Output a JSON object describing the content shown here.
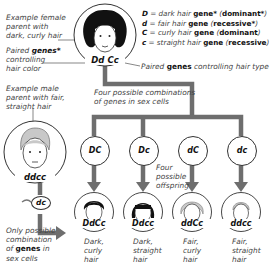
{
  "legend": [
    {
      "symbol": "D",
      "text": "dark hair",
      "gene": "gene*",
      "type": "dominant*"
    },
    {
      "symbol": "d",
      "text": "fair hair",
      "gene": "gene",
      "type": "recessive*"
    },
    {
      "symbol": "C",
      "text": "curly hair",
      "gene": "gene",
      "type": "dominant"
    },
    {
      "symbol": "c",
      "text": "straight hair",
      "gene": "gene",
      "type": "recessive"
    }
  ],
  "female_parent": {
    "caption_lines": [
      "Example female",
      "parent with",
      "dark, curly hair"
    ],
    "genotype": "Dd Cc",
    "color_genes_lines": [
      "Paired",
      "genes*",
      "controlling",
      "hair color"
    ],
    "type_genes": {
      "pre": "Paired",
      "bold": "genes",
      "post": "controlling hair type"
    }
  },
  "male_parent": {
    "caption_lines": [
      "Example male",
      "parent with fair,",
      "straight hair"
    ],
    "genotype": "ddcc",
    "gamete": "dc",
    "gamete_caption_lines": [
      "Only possible",
      "combination",
      "of",
      "genes",
      "in",
      "sex cells"
    ]
  },
  "gametes_caption_lines": [
    "Four possible combinations",
    "of genes in sex cells"
  ],
  "gametes": [
    "DC",
    "Dc",
    "dC",
    "dc"
  ],
  "offspring_caption_lines": [
    "Four",
    "possible",
    "offspring"
  ],
  "offspring": [
    {
      "genotype": "DdCc",
      "lines": [
        "Dark,",
        "curly",
        "hair"
      ]
    },
    {
      "genotype": "Ddcc",
      "lines": [
        "Dark,",
        "straight",
        "hair"
      ]
    },
    {
      "genotype": "ddCc",
      "lines": [
        "Fair,",
        "curly",
        "hair"
      ]
    },
    {
      "genotype": "ddcc",
      "lines": [
        "Fair,",
        "straight",
        "hair"
      ]
    }
  ],
  "colors": {
    "connector": "#6e6e6e",
    "dark_hair": "#111111",
    "fair_hair": "#c8c8c8"
  }
}
